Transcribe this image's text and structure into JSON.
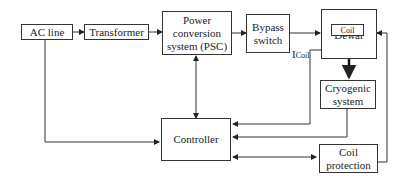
{
  "diagram": {
    "nodes": {
      "ac_line": "AC line",
      "transformer": "Transformer",
      "psc_l1": "Power",
      "psc_l2": "conversion",
      "psc_l3": "system (PSC)",
      "bypass_l1": "Bypass",
      "bypass_l2": "switch",
      "dewar": "Dewar",
      "coil": "Coil",
      "cryo_l1": "Cryogenic",
      "cryo_l2": "system",
      "controller": "Controller",
      "coilprot_l1": "Coil",
      "coilprot_l2": "protection"
    },
    "labels": {
      "icoil_main": "I",
      "icoil_sub": "Coil"
    },
    "edges": [
      {
        "from": "AC line",
        "to": "Transformer"
      },
      {
        "from": "Transformer",
        "to": "Power conversion system (PSC)"
      },
      {
        "from": "Power conversion system (PSC)",
        "to": "Bypass switch"
      },
      {
        "from": "Bypass switch",
        "to": "Dewar"
      },
      {
        "from": "Dewar",
        "to": "Cryogenic system"
      },
      {
        "from": "Power conversion system (PSC)",
        "to": "Controller",
        "bidirectional": true
      },
      {
        "from": "AC line",
        "to": "Controller"
      },
      {
        "from": "Dewar (I_Coil)",
        "to": "Controller"
      },
      {
        "from": "Cryogenic system",
        "to": "Controller"
      },
      {
        "from": "Controller",
        "to": "Coil protection",
        "bidirectional": true
      },
      {
        "from": "Coil protection",
        "to": "Dewar"
      }
    ]
  }
}
